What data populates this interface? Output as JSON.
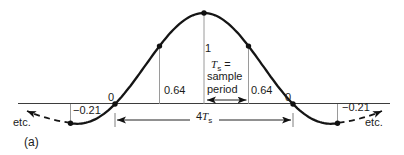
{
  "labels": {
    "peak": "1",
    "zero_left": "0",
    "zero_right": "0",
    "v64_left": "0.64",
    "v64_right": "0.64",
    "v21_left": "−0.21",
    "v21_right": "−0.21",
    "etc_left": "etc.",
    "etc_right": "etc.",
    "four": "4",
    "T": "T",
    "T_sub": "s",
    "equals": "=",
    "sample_word": "sample",
    "period_word": "period",
    "caption": "(a)"
  },
  "chart_data": {
    "type": "line",
    "title": "",
    "curve": "y = sin(πx/2) / (πx/2), x in units of Ts",
    "x_unit": "Ts = sample period",
    "samples": [
      {
        "x": -3,
        "y": -0.21
      },
      {
        "x": -2,
        "y": 0
      },
      {
        "x": -1,
        "y": 0.64
      },
      {
        "x": 0,
        "y": 1
      },
      {
        "x": 1,
        "y": 0.64
      },
      {
        "x": 2,
        "y": 0
      },
      {
        "x": 3,
        "y": -0.21
      }
    ],
    "ylim": [
      -0.3,
      1.1
    ],
    "annotations": [
      {
        "text": "Ts = sample period",
        "span": "from peak (0) to +1 Ts, double-headed arrow"
      },
      {
        "text": "4Ts",
        "span": "between the two zero crossings (-2Ts to +2Ts), double-headed arrow"
      },
      {
        "text": "etc.",
        "meaning": "dashed curve continues beyond both sides"
      },
      {
        "text": "(a)",
        "meaning": "subfigure caption"
      }
    ],
    "colors": {
      "curve": "#151515",
      "guide_lines": "#8f8f8f",
      "axis": "#3d3d3d",
      "text": "#1b1b1b",
      "background": "#ffffff"
    }
  }
}
